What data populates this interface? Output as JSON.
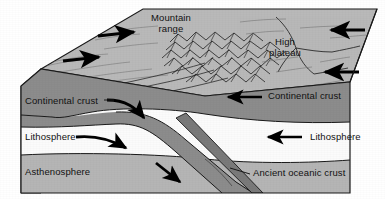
{
  "figure": {
    "type": "geological-block-diagram",
    "width": 385,
    "height": 199
  },
  "palette": {
    "background": "#ffffff",
    "top_surface": "#b9b9b9",
    "top_surface_shaded": "#a8a8a8",
    "continental_crust_fill": "#8c8c8c",
    "lithosphere_fill": "#fbfbfb",
    "asthenosphere_fill": "#b5b5b5",
    "oceanic_slab_fill": "#7a7a7a",
    "outline": "#1a1a1a",
    "arrow": "#000000",
    "text": "#111111"
  },
  "labels": {
    "mountain_range": {
      "line1": "Mountain",
      "line2": "range"
    },
    "high_plateau": {
      "line1": "High",
      "line2": "plateau"
    },
    "continental_crust_left": "Continental crust",
    "continental_crust_right": "Continental crust",
    "lithosphere_left": "Lithosphere",
    "lithosphere_right": "Lithosphere",
    "asthenosphere": "Asthenosphere",
    "ancient_oceanic_crust": "Ancient oceanic crust"
  },
  "arrows": [
    {
      "name": "surface-arrow-left-upper",
      "direction": "right",
      "surface": "top",
      "meaning": "plate motion toward collision"
    },
    {
      "name": "surface-arrow-left-lower",
      "direction": "right",
      "surface": "top",
      "meaning": "plate motion toward collision"
    },
    {
      "name": "surface-arrow-right-upper",
      "direction": "left",
      "surface": "top",
      "meaning": "plate motion toward collision"
    },
    {
      "name": "surface-arrow-right-lower",
      "direction": "left",
      "surface": "top",
      "meaning": "plate motion toward collision"
    },
    {
      "name": "crust-arrow-right",
      "direction": "left",
      "surface": "front",
      "meaning": "continental crust convergence"
    },
    {
      "name": "lithosphere-arrow-right",
      "direction": "left",
      "surface": "front",
      "meaning": "lithosphere convergence"
    },
    {
      "name": "crust-arrow-left-curved",
      "direction": "down-right",
      "surface": "front",
      "meaning": "continental crust underthrusting"
    },
    {
      "name": "lithosphere-arrow-left-curved",
      "direction": "right",
      "surface": "front",
      "meaning": "lithosphere underthrusting"
    },
    {
      "name": "asthenosphere-arrow-slab",
      "direction": "down-right",
      "surface": "front",
      "meaning": "slab descending into asthenosphere"
    }
  ],
  "layers": [
    {
      "name": "continental-crust",
      "label": "Continental crust",
      "fill": "#8c8c8c"
    },
    {
      "name": "lithosphere",
      "label": "Lithosphere",
      "fill": "#fbfbfb"
    },
    {
      "name": "asthenosphere",
      "label": "Asthenosphere",
      "fill": "#b5b5b5"
    },
    {
      "name": "ancient-oceanic-crust",
      "label": "Ancient oceanic crust",
      "fill": "#7a7a7a"
    }
  ]
}
